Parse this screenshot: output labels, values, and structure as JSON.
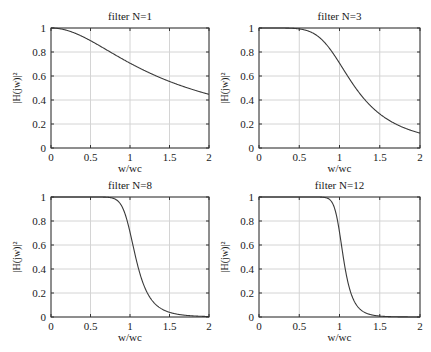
{
  "chart_data": [
    {
      "type": "line",
      "title": "filter N=1",
      "order": 1,
      "xlabel": "w/wc",
      "ylabel": "|H(jw)|²",
      "xlim": [
        0,
        2
      ],
      "ylim": [
        0,
        1
      ],
      "xticks": [
        "0",
        "0.5",
        "1",
        "1.5",
        "2"
      ],
      "yticks": [
        "0",
        "0.2",
        "0.4",
        "0.6",
        "0.8",
        "1"
      ],
      "grid": true,
      "x": [
        0,
        0.1,
        0.2,
        0.3,
        0.4,
        0.5,
        0.6,
        0.7,
        0.8,
        0.9,
        1.0,
        1.1,
        1.2,
        1.3,
        1.4,
        1.5,
        1.6,
        1.7,
        1.8,
        1.9,
        2.0
      ],
      "y": [
        1.0,
        0.995,
        0.981,
        0.958,
        0.928,
        0.894,
        0.857,
        0.819,
        0.781,
        0.743,
        0.707,
        0.673,
        0.64,
        0.61,
        0.581,
        0.555,
        0.53,
        0.507,
        0.486,
        0.466,
        0.447
      ]
    },
    {
      "type": "line",
      "title": "filter N=3",
      "order": 3,
      "xlabel": "w/wc",
      "ylabel": "|H(jw)|²",
      "xlim": [
        0,
        2
      ],
      "ylim": [
        0,
        1
      ],
      "xticks": [
        "0",
        "0.5",
        "1",
        "1.5",
        "2"
      ],
      "yticks": [
        "0",
        "0.2",
        "0.4",
        "0.6",
        "0.8",
        "1"
      ],
      "grid": true,
      "x": [
        0,
        0.1,
        0.2,
        0.3,
        0.4,
        0.5,
        0.6,
        0.7,
        0.8,
        0.9,
        1.0,
        1.1,
        1.2,
        1.3,
        1.4,
        1.5,
        1.6,
        1.7,
        1.8,
        1.9,
        2.0
      ],
      "y": [
        1.0,
        1.0,
        1.0,
        1.0,
        0.998,
        0.992,
        0.977,
        0.946,
        0.89,
        0.808,
        0.707,
        0.601,
        0.501,
        0.414,
        0.342,
        0.284,
        0.237,
        0.2,
        0.169,
        0.144,
        0.124
      ]
    },
    {
      "type": "line",
      "title": "filter N=8",
      "order": 8,
      "xlabel": "w/wc",
      "ylabel": "|H(jw)|²",
      "xlim": [
        0,
        2
      ],
      "ylim": [
        0,
        1
      ],
      "xticks": [
        "0",
        "0.5",
        "1",
        "1.5",
        "2"
      ],
      "yticks": [
        "0",
        "0.2",
        "0.4",
        "0.6",
        "0.8",
        "1"
      ],
      "grid": true,
      "x": [
        0,
        0.1,
        0.2,
        0.3,
        0.4,
        0.5,
        0.6,
        0.7,
        0.8,
        0.9,
        1.0,
        1.1,
        1.2,
        1.3,
        1.4,
        1.5,
        1.6,
        1.7,
        1.8,
        1.9,
        2.0
      ],
      "y": [
        1.0,
        1.0,
        1.0,
        1.0,
        1.0,
        1.0,
        1.0,
        0.998,
        0.986,
        0.919,
        0.707,
        0.423,
        0.226,
        0.122,
        0.068,
        0.039,
        0.023,
        0.014,
        0.009,
        0.006,
        0.004
      ]
    },
    {
      "type": "line",
      "title": "filter N=12",
      "order": 12,
      "xlabel": "w/wc",
      "ylabel": "|H(jw)|²",
      "xlim": [
        0,
        2
      ],
      "ylim": [
        0,
        1
      ],
      "xticks": [
        "0",
        "0.5",
        "1",
        "1.5",
        "2"
      ],
      "yticks": [
        "0",
        "0.2",
        "0.4",
        "0.6",
        "0.8",
        "1"
      ],
      "grid": true,
      "x": [
        0,
        0.1,
        0.2,
        0.3,
        0.4,
        0.5,
        0.6,
        0.7,
        0.8,
        0.9,
        1.0,
        1.1,
        1.2,
        1.3,
        1.4,
        1.5,
        1.6,
        1.7,
        1.8,
        1.9,
        2.0
      ],
      "y": [
        1.0,
        1.0,
        1.0,
        1.0,
        1.0,
        1.0,
        1.0,
        1.0,
        0.998,
        0.962,
        0.707,
        0.304,
        0.112,
        0.043,
        0.018,
        0.008,
        0.003,
        0.001,
        0.0,
        0.0,
        0.0
      ]
    }
  ],
  "style": {
    "line_color": "#3a3a3a",
    "grid_color": "#d4d4d4",
    "axes_color": "#333333",
    "text_color": "#1a1a1a"
  },
  "layout": {
    "panels": [
      {
        "left": 51,
        "top": 28,
        "right": 209,
        "bottom": 148
      },
      {
        "left": 259,
        "top": 28,
        "right": 420,
        "bottom": 148
      },
      {
        "left": 51,
        "top": 197,
        "right": 209,
        "bottom": 317
      },
      {
        "left": 259,
        "top": 197,
        "right": 420,
        "bottom": 317
      }
    ]
  }
}
